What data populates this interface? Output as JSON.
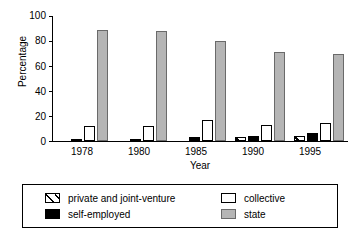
{
  "chart_data": {
    "type": "bar",
    "title": "",
    "xlabel": "Year",
    "ylabel": "Percentage",
    "categories": [
      "1978",
      "1980",
      "1985",
      "1990",
      "1995"
    ],
    "ylim": [
      0,
      100
    ],
    "yticks": [
      0,
      20,
      40,
      60,
      80,
      100
    ],
    "grid": false,
    "legend_position": "bottom",
    "series": [
      {
        "name": "private and joint-venture",
        "style": "hatched",
        "color": "#ffffff",
        "values": [
          0,
          0,
          0,
          3,
          4
        ]
      },
      {
        "name": "self-employed",
        "style": "solid",
        "color": "#000000",
        "values": [
          1,
          1,
          3,
          4,
          6
        ]
      },
      {
        "name": "collective",
        "style": "solid",
        "color": "#ffffff",
        "values": [
          12,
          12,
          17,
          13,
          14
        ]
      },
      {
        "name": "state",
        "style": "solid",
        "color": "#b5b5b5",
        "values": [
          88,
          87,
          79,
          71,
          69
        ]
      }
    ]
  },
  "axes": {
    "ylabel": "Percentage",
    "xlabel": "Year",
    "ytick_labels": [
      "100",
      "80",
      "60",
      "40",
      "20",
      "0"
    ],
    "xtick_labels": [
      "1978",
      "1980",
      "1985",
      "1990",
      "1995"
    ]
  },
  "legend": {
    "items": [
      {
        "label": "private and joint-venture",
        "swatch": "hatched-swatch"
      },
      {
        "label": "collective",
        "swatch": "white-swatch"
      },
      {
        "label": "self-employed",
        "swatch": "black-swatch"
      },
      {
        "label": "state",
        "swatch": "gray-swatch"
      }
    ]
  }
}
